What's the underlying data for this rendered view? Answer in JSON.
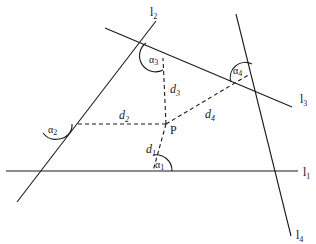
{
  "diagram": {
    "lines": [
      {
        "id": "l1",
        "label": "l",
        "sub": "1"
      },
      {
        "id": "l2",
        "label": "l",
        "sub": "2"
      },
      {
        "id": "l3",
        "label": "l",
        "sub": "3"
      },
      {
        "id": "l4",
        "label": "l",
        "sub": "4"
      }
    ],
    "point": {
      "label": "P"
    },
    "distances": [
      {
        "label": "d",
        "sub": "1"
      },
      {
        "label": "d",
        "sub": "2"
      },
      {
        "label": "d",
        "sub": "3"
      },
      {
        "label": "d",
        "sub": "4"
      }
    ],
    "angles": [
      {
        "label": "α",
        "sub": "1"
      },
      {
        "label": "α",
        "sub": "2"
      },
      {
        "label": "α",
        "sub": "3"
      },
      {
        "label": "α",
        "sub": "4"
      }
    ],
    "colors": {
      "stroke": "#1a1a1a",
      "background": "#ffffff"
    }
  }
}
